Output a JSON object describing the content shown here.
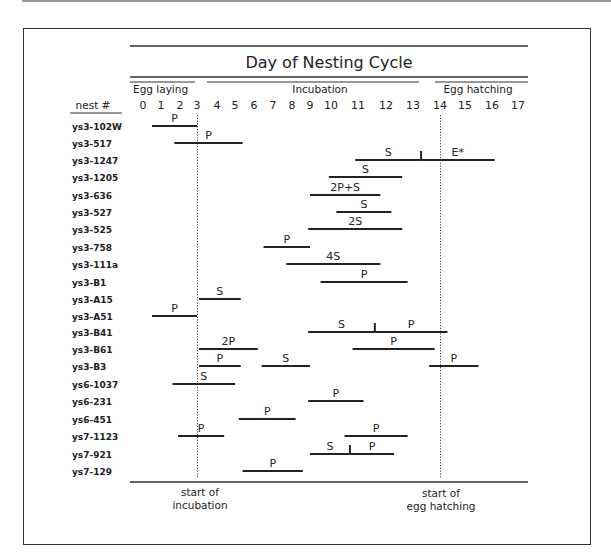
{
  "chart_data": {
    "type": "gantt",
    "title": "Day of Nesting Cycle",
    "xlabel": "Day of Nesting Cycle",
    "ylabel": "nest #",
    "x_ticks": [
      0,
      1,
      2,
      3,
      4,
      5,
      6,
      7,
      8,
      9,
      10,
      11,
      12,
      13,
      14,
      15,
      16,
      17
    ],
    "xlim": [
      0,
      17
    ],
    "phases": [
      {
        "label": "Egg laying",
        "start": 0,
        "end": 3
      },
      {
        "label": "Incubation",
        "start": 3,
        "end": 14
      },
      {
        "label": "Egg hatching",
        "start": 14,
        "end": 17
      }
    ],
    "reference_lines": [
      {
        "day": 3,
        "label": "start of incubation",
        "style": "dotted"
      },
      {
        "day": 14,
        "label": "start of egg hatching",
        "style": "dotted"
      }
    ],
    "rows": [
      {
        "nest": "ys3-102W",
        "segments": [
          {
            "start": 0.5,
            "end": 3,
            "label": "P"
          }
        ]
      },
      {
        "nest": "ys3-517",
        "segments": [
          {
            "start": 1.7,
            "end": 5.4,
            "label": "P"
          }
        ]
      },
      {
        "nest": "ys3-1247",
        "segments": [
          {
            "start": 10.9,
            "end": 13.3,
            "label": "S"
          },
          {
            "start": 13.3,
            "end": 16.1,
            "label": "E*"
          }
        ],
        "markers": [
          13.3
        ]
      },
      {
        "nest": "ys3-1205",
        "segments": [
          {
            "start": 9.9,
            "end": 12.6,
            "label": "S"
          }
        ]
      },
      {
        "nest": "ys3-636",
        "segments": [
          {
            "start": 9.0,
            "end": 11.8,
            "label": "2P+S"
          }
        ]
      },
      {
        "nest": "ys3-527",
        "segments": [
          {
            "start": 10.2,
            "end": 12.2,
            "label": "S"
          }
        ]
      },
      {
        "nest": "ys3-525",
        "segments": [
          {
            "start": 8.9,
            "end": 12.6,
            "label": "2S"
          }
        ]
      },
      {
        "nest": "ys3-758",
        "segments": [
          {
            "start": 6.5,
            "end": 9.0,
            "label": "P"
          }
        ]
      },
      {
        "nest": "ys3-111a",
        "segments": [
          {
            "start": 7.7,
            "end": 11.8,
            "label": "4S"
          }
        ]
      },
      {
        "nest": "ys3-B1",
        "segments": [
          {
            "start": 9.5,
            "end": 12.8,
            "label": "P"
          }
        ]
      },
      {
        "nest": "ys3-A15",
        "segments": [
          {
            "start": 3.1,
            "end": 5.3,
            "label": "S"
          }
        ]
      },
      {
        "nest": "ys3-A51",
        "segments": [
          {
            "start": 0.5,
            "end": 3.0,
            "label": "P"
          }
        ]
      },
      {
        "nest": "ys3-B41",
        "segments": [
          {
            "start": 8.9,
            "end": 11.6,
            "label": "S"
          },
          {
            "start": 11.6,
            "end": 14.3,
            "label": "P"
          }
        ],
        "markers": [
          11.6
        ]
      },
      {
        "nest": "ys3-B61",
        "segments": [
          {
            "start": 3.1,
            "end": 6.2,
            "label": "2P"
          },
          {
            "start": 10.8,
            "end": 13.8,
            "label": "P"
          }
        ]
      },
      {
        "nest": "ys3-B3",
        "segments": [
          {
            "start": 3.1,
            "end": 5.3,
            "label": "P"
          },
          {
            "start": 6.4,
            "end": 9.0,
            "label": "S"
          },
          {
            "start": 13.6,
            "end": 15.5,
            "label": "P"
          }
        ]
      },
      {
        "nest": "ys6-1037",
        "segments": [
          {
            "start": 1.6,
            "end": 5.0,
            "label": "S"
          }
        ]
      },
      {
        "nest": "ys6-231",
        "segments": [
          {
            "start": 8.9,
            "end": 11.2,
            "label": "P"
          }
        ]
      },
      {
        "nest": "ys6-451",
        "segments": [
          {
            "start": 5.2,
            "end": 8.2,
            "label": "P"
          }
        ]
      },
      {
        "nest": "ys7-1123",
        "segments": [
          {
            "start": 1.9,
            "end": 4.4,
            "label": "P"
          },
          {
            "start": 10.5,
            "end": 12.8,
            "label": "P"
          }
        ]
      },
      {
        "nest": "ys7-921",
        "segments": [
          {
            "start": 9.0,
            "end": 10.7,
            "label": "S"
          },
          {
            "start": 10.7,
            "end": 12.3,
            "label": "P"
          }
        ],
        "markers": [
          10.7
        ]
      },
      {
        "nest": "ys7-129",
        "segments": [
          {
            "start": 5.4,
            "end": 8.6,
            "label": "P"
          }
        ]
      }
    ],
    "grid": false,
    "legend": null
  },
  "labels": {
    "title": "Day of Nesting Cycle",
    "nest_header": "nest #",
    "phase_egg_laying": "Egg laying",
    "phase_incubation": "Incubation",
    "phase_egg_hatching": "Egg hatching",
    "ref_incubation_line1": "start of",
    "ref_incubation_line2": "incubation",
    "ref_hatching_line1": "start of",
    "ref_hatching_line2": "egg hatching"
  }
}
